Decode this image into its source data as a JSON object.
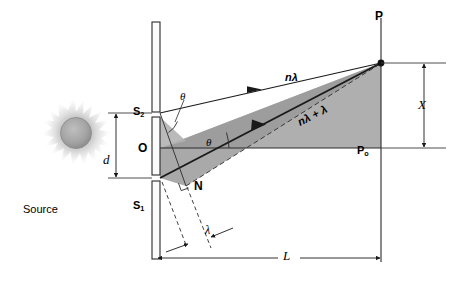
{
  "diagram": {
    "type": "optics-ray-diagram",
    "background_color": "#ffffff",
    "ink_color": "#000000",
    "shade_color": "#a8a8a8",
    "shade_color_dark": "#949494",
    "source_glow_color": "#b9b9b9",
    "source_core_color": "#9e9e9e"
  },
  "labels": {
    "source": "Source",
    "slit_upper": "S",
    "slit_upper_sub": "2",
    "slit_lower": "S",
    "slit_lower_sub": "1",
    "origin": "O",
    "foot_normal": "N",
    "screen_point": "P",
    "screen_center": "P",
    "screen_center_sub": "o",
    "separation": "d",
    "distance": "L",
    "fringe_offset": "X",
    "path_upper": "nλ",
    "path_lower": "nλ + λ",
    "wavelength": "λ",
    "angle_at_slit": "θ",
    "angle_at_origin": "θ"
  },
  "geometry": {
    "slit_barrier_x": 155,
    "slit_upper_y": 113,
    "slit_lower_y": 178,
    "origin_y": 148,
    "screen_x": 381,
    "screen_point_y": 63,
    "screen_center_y": 148,
    "normal_point": [
      186,
      186
    ],
    "axis_label_X": "X",
    "axis_label_L": "L",
    "axis_label_d": "d"
  },
  "annotations": {
    "icon_names": [
      "light-source-icon",
      "slit-barrier-icon",
      "ray-arrow-icon",
      "dimension-arrow-icon",
      "angle-arc-icon"
    ]
  }
}
